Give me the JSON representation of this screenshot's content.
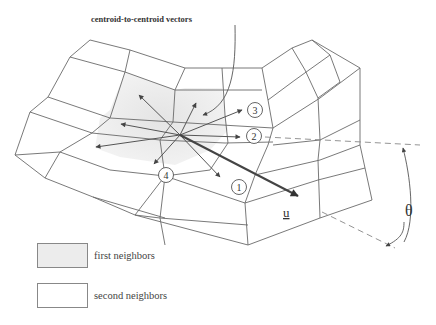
{
  "figure": {
    "annotation": "centroid-to-centroid vectors",
    "vector_label": "u",
    "angle_label": "θ",
    "neighbor_labels": [
      "1",
      "2",
      "3",
      "4"
    ],
    "colors": {
      "first_neighbor_fill": "#ebebeb",
      "second_neighbor_fill": "#ffffff",
      "mesh_line": "#6a6a6a",
      "arrow": "#555555"
    }
  },
  "legend": {
    "items": [
      {
        "label": "first neighbors",
        "fill": "#ececec"
      },
      {
        "label": "second neighbors",
        "fill": "#ffffff"
      }
    ]
  }
}
